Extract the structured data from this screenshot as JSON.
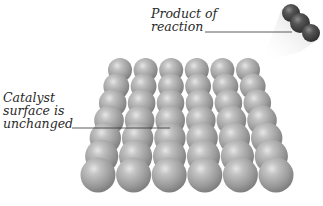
{
  "diagram": {
    "labels": {
      "product": [
        "Product of",
        "reaction"
      ],
      "catalyst": [
        "Catalyst",
        "surface is",
        "unchanged"
      ]
    },
    "catalyst_surface": {
      "columns": 6,
      "rows": 7,
      "atom_color": "#9a9a9a"
    },
    "product_molecule": {
      "atoms": 3,
      "atom_color": "#4a4a4a",
      "motion": "leaving surface, up-right"
    }
  }
}
